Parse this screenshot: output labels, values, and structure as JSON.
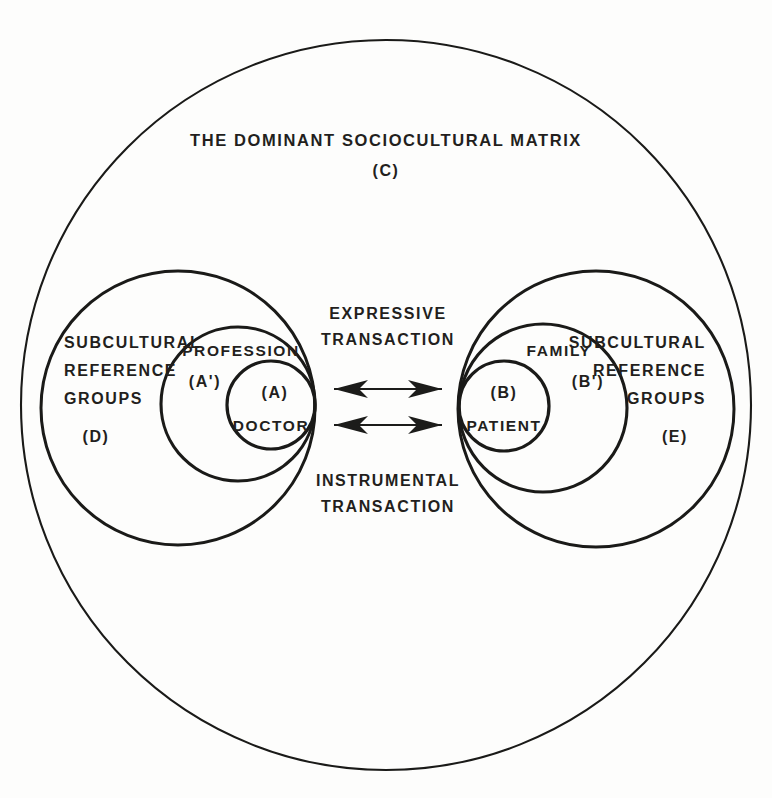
{
  "diagram": {
    "title_line1": "THE DOMINANT SOCIOCULTURAL MATRIX",
    "title_code": "(C)",
    "left_cluster": {
      "outer_label_line1": "SUBCULTURAL",
      "outer_label_line2": "REFERENCE",
      "outer_label_line3": "GROUPS",
      "outer_code": "(D)",
      "middle_label": "PROFESSION",
      "middle_code": "(A')",
      "inner_code": "(A)",
      "inner_label": "DOCTOR"
    },
    "right_cluster": {
      "outer_label_line1": "SUBCULTURAL",
      "outer_label_line2": "REFERENCE",
      "outer_label_line3": "GROUPS",
      "outer_code": "(E)",
      "middle_label": "FAMILY",
      "middle_code": "(B')",
      "inner_code": "(B)",
      "inner_label": "PATIENT"
    },
    "center": {
      "top_label_line1": "EXPRESSIVE",
      "top_label_line2": "TRANSACTION",
      "bottom_label_line1": "INSTRUMENTAL",
      "bottom_label_line2": "TRANSACTION"
    },
    "colors": {
      "ink": "#1a1a18",
      "text": "#231f1d",
      "background": "#fdfdfc"
    }
  }
}
